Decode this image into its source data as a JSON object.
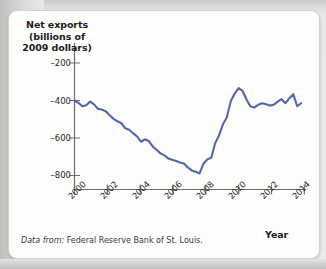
{
  "figure": {
    "source_note_lead": "Data from:",
    "source_note_body": " Federal Reserve Bank of St. Louis.",
    "line_color": "#5566b0",
    "axis_color": "#6f6f6f",
    "card_background": "#fdfdfc",
    "page_background": "#e9e9e7"
  },
  "chart_data": {
    "type": "line",
    "title": "",
    "ylabel": "Net exports (billions of 2009 dollars)",
    "xlabel": "Year",
    "ylabel_lines": [
      "Net exports",
      "(billions of",
      "2009 dollars)"
    ],
    "xlim": [
      2000,
      2014.75
    ],
    "ylim": [
      -870,
      -140
    ],
    "grid": false,
    "legend": "none",
    "yticks": [
      -200,
      -400,
      -600,
      -800
    ],
    "ytick_labels": [
      "–200",
      "–400",
      "–600",
      "–800"
    ],
    "xticks": [
      2000,
      2002,
      2004,
      2006,
      2008,
      2010,
      2012,
      2014
    ],
    "xtick_labels": [
      "2000",
      "2002",
      "2004",
      "2006",
      "2008",
      "2010",
      "2012",
      "2014"
    ],
    "series": [
      {
        "name": "Net exports",
        "color": "#5566b0",
        "x": [
          2000.0,
          2000.25,
          2000.5,
          2000.75,
          2001.0,
          2001.25,
          2001.5,
          2001.75,
          2002.0,
          2002.25,
          2002.5,
          2002.75,
          2003.0,
          2003.25,
          2003.5,
          2003.75,
          2004.0,
          2004.25,
          2004.5,
          2004.75,
          2005.0,
          2005.25,
          2005.5,
          2005.75,
          2006.0,
          2006.25,
          2006.5,
          2006.75,
          2007.0,
          2007.25,
          2007.5,
          2007.75,
          2008.0,
          2008.25,
          2008.5,
          2008.75,
          2009.0,
          2009.25,
          2009.5,
          2009.75,
          2010.0,
          2010.25,
          2010.5,
          2010.75,
          2011.0,
          2011.25,
          2011.5,
          2011.75,
          2012.0,
          2012.25,
          2012.5,
          2012.75,
          2013.0,
          2013.25,
          2013.5,
          2013.75,
          2014.0,
          2014.25,
          2014.5
        ],
        "values": [
          -428,
          -438,
          -455,
          -450,
          -432,
          -446,
          -468,
          -472,
          -480,
          -500,
          -518,
          -530,
          -540,
          -565,
          -572,
          -590,
          -605,
          -632,
          -620,
          -628,
          -655,
          -672,
          -690,
          -700,
          -715,
          -722,
          -728,
          -735,
          -740,
          -760,
          -775,
          -782,
          -790,
          -742,
          -720,
          -712,
          -640,
          -600,
          -545,
          -510,
          -430,
          -392,
          -365,
          -378,
          -420,
          -455,
          -462,
          -448,
          -440,
          -445,
          -452,
          -448,
          -432,
          -420,
          -440,
          -415,
          -395,
          -455,
          -440
        ]
      }
    ]
  }
}
